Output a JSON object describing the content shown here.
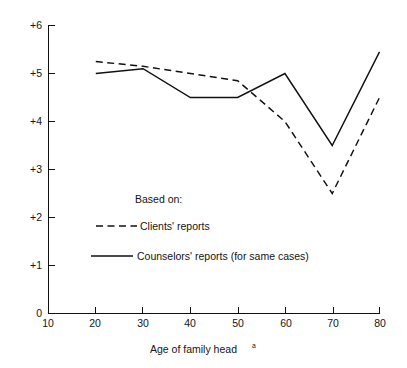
{
  "chart_data": {
    "type": "line",
    "title": "",
    "subtitle": "",
    "xlabel": "Age of family head",
    "xlabel_superscript": "a",
    "ylabel": "",
    "xlim": [
      10,
      80
    ],
    "ylim": [
      0,
      6
    ],
    "grid": false,
    "legend_position": "inside-center-left",
    "x": [
      20,
      30,
      40,
      50,
      60,
      70,
      80
    ],
    "xticks": [
      10,
      20,
      30,
      40,
      50,
      60,
      70,
      80
    ],
    "xticklabels": [
      "10",
      "20",
      "30",
      "40",
      "50",
      "60",
      "70",
      "80"
    ],
    "yticks": [
      0,
      1,
      2,
      3,
      4,
      5,
      6
    ],
    "yticklabels": [
      "0",
      "+1",
      "+2",
      "+3",
      "+4",
      "+5",
      "+6"
    ],
    "series": [
      {
        "name": "Clients' reports",
        "style": "dashed",
        "color": "#111111",
        "values": [
          5.25,
          5.15,
          5.0,
          4.85,
          4.0,
          2.5,
          4.5
        ]
      },
      {
        "name": "Counselors' reports (for same cases)",
        "style": "solid",
        "color": "#111111",
        "values": [
          5.0,
          5.1,
          4.5,
          4.5,
          5.0,
          3.5,
          5.45
        ]
      }
    ]
  },
  "legend": {
    "heading": "Based on:",
    "entries": [
      {
        "label": "Clients' reports",
        "style": "dashed"
      },
      {
        "label": "Counselors' reports (for same cases)",
        "style": "solid"
      }
    ]
  },
  "axes": {
    "y_labels": [
      "+6",
      "+5",
      "+4",
      "+3",
      "+2",
      "+1",
      "0"
    ],
    "x_labels": [
      "10",
      "20",
      "30",
      "40",
      "50",
      "60",
      "70",
      "80"
    ],
    "x_title": "Age of family head",
    "x_title_note": "a"
  }
}
